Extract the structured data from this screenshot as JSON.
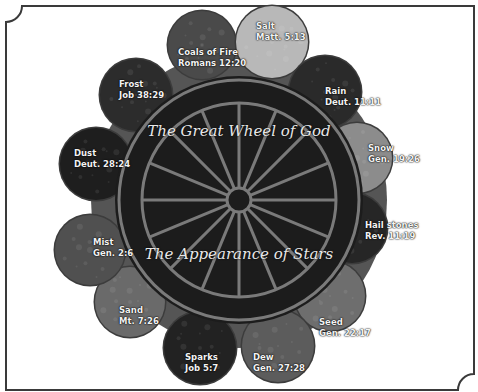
{
  "title_top": "The Great Wheel of God",
  "title_bottom": "The Appearance of Stars",
  "colors": {
    "frame_stroke": "#3a3a3a",
    "disc_fill": "#1c1c1c",
    "ring_stroke": "#7a7a7a",
    "backing": "#555555",
    "label_text": "#f2f2f2"
  },
  "wheel": {
    "center": [
      239,
      200
    ],
    "outer_ring_radius": 120,
    "inner_rim_radius": 97,
    "hub_radius": 12,
    "spoke_count": 16
  },
  "bubbles": [
    {
      "name": "Coals of Fire",
      "ref": "Romans 12:20",
      "cx": 202,
      "cy": 45,
      "r": 34,
      "fill": "#4a4a4a"
    },
    {
      "name": "Salt",
      "ref": "Matt. 5:13",
      "cx": 272,
      "cy": 42,
      "r": 36,
      "fill": "#b8b8b8"
    },
    {
      "name": "Rain",
      "ref": "Deut. 11:11",
      "cx": 325,
      "cy": 92,
      "r": 36,
      "fill": "#2a2a2a"
    },
    {
      "name": "Snow",
      "ref": "Gen. 19:26",
      "cx": 357,
      "cy": 158,
      "r": 35,
      "fill": "#8c8c8c"
    },
    {
      "name": "Hail stones",
      "ref": "Rev. 11:19",
      "cx": 352,
      "cy": 228,
      "r": 35,
      "fill": "#262626"
    },
    {
      "name": "Seed",
      "ref": "Gen. 22:17",
      "cx": 330,
      "cy": 296,
      "r": 35,
      "fill": "#6e6e6e"
    },
    {
      "name": "Dew",
      "ref": "Gen. 27:28",
      "cx": 278,
      "cy": 346,
      "r": 36,
      "fill": "#5c5c5c"
    },
    {
      "name": "Sparks",
      "ref": "Job 5:7",
      "cx": 200,
      "cy": 348,
      "r": 36,
      "fill": "#222222"
    },
    {
      "name": "Sand",
      "ref": "Mt. 7:26",
      "cx": 130,
      "cy": 302,
      "r": 35,
      "fill": "#6a6a6a"
    },
    {
      "name": "Mist",
      "ref": "Gen. 2:6",
      "cx": 90,
      "cy": 250,
      "r": 35,
      "fill": "#505050"
    },
    {
      "name": "Dust",
      "ref": "Deut. 28:24",
      "cx": 96,
      "cy": 164,
      "r": 36,
      "fill": "#1e1e1e"
    },
    {
      "name": "Frost",
      "ref": "Job 38:29",
      "cx": 136,
      "cy": 95,
      "r": 36,
      "fill": "#2c2c2c"
    }
  ],
  "labels": [
    {
      "name": "Coals of Fire",
      "ref": "Romans 12:20",
      "x": 178,
      "y": 47
    },
    {
      "name": "Salt",
      "ref": "Matt. 5:13",
      "x": 256,
      "y": 21
    },
    {
      "name": "Rain",
      "ref": "Deut. 11:11",
      "x": 325,
      "y": 86
    },
    {
      "name": "Snow",
      "ref": "Gen. 19:26",
      "x": 368,
      "y": 143
    },
    {
      "name": "Hail stones",
      "ref": "Rev. 11:19",
      "x": 365,
      "y": 220
    },
    {
      "name": "Seed",
      "ref": "Gen. 22:17",
      "x": 319,
      "y": 317
    },
    {
      "name": "Dew",
      "ref": "Gen. 27:28",
      "x": 253,
      "y": 352
    },
    {
      "name": "Sparks",
      "ref": "Job 5:7",
      "x": 185,
      "y": 352
    },
    {
      "name": "Sand",
      "ref": "Mt. 7:26",
      "x": 119,
      "y": 305
    },
    {
      "name": "Mist",
      "ref": "Gen. 2:6",
      "x": 93,
      "y": 237
    },
    {
      "name": "Dust",
      "ref": "Deut. 28:24",
      "x": 74,
      "y": 148
    },
    {
      "name": "Frost",
      "ref": "Job 38:29",
      "x": 119,
      "y": 79
    }
  ]
}
